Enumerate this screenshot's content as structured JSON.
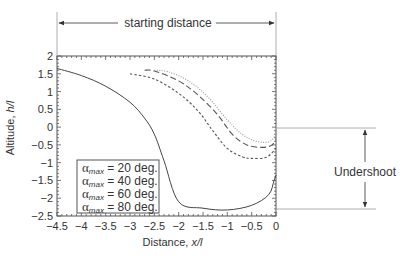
{
  "chart_data": {
    "type": "line",
    "title": "",
    "xlabel": "Distance, x/l",
    "ylabel": "Altitude, h/l",
    "xlim": [
      -4.5,
      0
    ],
    "ylim": [
      -2.5,
      2
    ],
    "x_ticks": [
      -4.5,
      -4,
      -3.5,
      -3,
      -2.5,
      -2,
      -1.5,
      -1,
      -0.5,
      0
    ],
    "y_ticks": [
      2,
      1.5,
      1,
      0.5,
      0,
      -0.5,
      -1,
      -1.5,
      -2,
      -2.5
    ],
    "x_tick_labels": [
      "−4.5",
      "−4",
      "−3.5",
      "−3",
      "−2.5",
      "−2",
      "−1.5",
      "−1",
      "−0.5",
      "0"
    ],
    "y_tick_labels": [
      "2",
      "1.5",
      "1",
      "0.5",
      "0",
      "−0.5",
      "−1",
      "−1.5",
      "−2",
      "−2.5"
    ],
    "grid": false,
    "legend_position": "lower left",
    "legend": [
      {
        "prefix": "α",
        "sub": "max",
        "suffix": " = 20 deg."
      },
      {
        "prefix": "α",
        "sub": "max",
        "suffix": " = 40 deg."
      },
      {
        "prefix": "α",
        "sub": "max",
        "suffix": " = 60 deg."
      },
      {
        "prefix": "α",
        "sub": "max",
        "suffix": " = 80 deg."
      }
    ],
    "series": [
      {
        "name": "αmax = 20 deg.",
        "style": "solid",
        "x": [
          -4.5,
          -4.0,
          -3.5,
          -3.0,
          -2.7,
          -2.5,
          -2.3,
          -2.0,
          -1.5,
          -1.0,
          -0.5,
          -0.15,
          -0.04,
          0
        ],
        "y": [
          1.65,
          1.45,
          1.15,
          0.7,
          0.25,
          -0.2,
          -0.95,
          -2.1,
          -2.28,
          -2.33,
          -2.2,
          -1.9,
          -1.5,
          -1.35
        ]
      },
      {
        "name": "αmax = 40 deg.",
        "style": "short-dash",
        "x": [
          -3.0,
          -2.5,
          -2.0,
          -1.6,
          -1.3,
          -1.0,
          -0.7,
          -0.5,
          -0.2,
          0
        ],
        "y": [
          1.5,
          1.35,
          0.95,
          0.45,
          -0.1,
          -0.6,
          -0.83,
          -0.88,
          -0.85,
          -0.6
        ]
      },
      {
        "name": "αmax = 60 deg.",
        "style": "long-dash",
        "x": [
          -2.7,
          -2.5,
          -2.0,
          -1.6,
          -1.2,
          -0.9,
          -0.6,
          -0.3,
          -0.1,
          0
        ],
        "y": [
          1.6,
          1.58,
          1.3,
          0.9,
          0.35,
          -0.2,
          -0.5,
          -0.57,
          -0.52,
          -0.35
        ]
      },
      {
        "name": "αmax = 80 deg.",
        "style": "dotted",
        "x": [
          -2.5,
          -2.2,
          -1.8,
          -1.4,
          -1.0,
          -0.7,
          -0.45,
          -0.25,
          -0.1,
          0
        ],
        "y": [
          1.6,
          1.55,
          1.3,
          0.85,
          0.2,
          -0.2,
          -0.38,
          -0.43,
          -0.38,
          -0.2
        ]
      }
    ],
    "annotations": [
      {
        "text": "starting distance",
        "type": "double-arrow-horizontal",
        "from_x": -4.5,
        "to_x": 0
      },
      {
        "text": "Undershoot",
        "type": "double-arrow-vertical",
        "from_y": 0,
        "to_y": -2.33
      }
    ]
  },
  "labels": {
    "starting_distance": "starting distance",
    "undershoot": "Undershoot",
    "xlabel_main": "Distance, ",
    "xlabel_var": "x/l",
    "ylabel_main": "Altitude, ",
    "ylabel_var": "h/l"
  },
  "colors": {
    "axis": "#555555",
    "line": "#444444",
    "ref": "#999999"
  }
}
